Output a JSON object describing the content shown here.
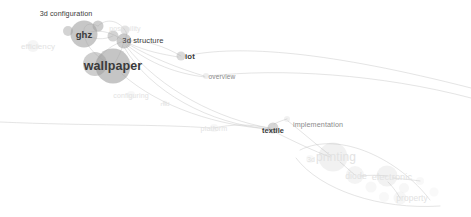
{
  "graph": {
    "title": "",
    "background_color": "#ffffff",
    "node_color": "#9e9e9e",
    "edge_color": "#c9c9c9",
    "label_color_strong": "#3a3a3a",
    "label_color_mid": "#8a8a8a",
    "label_color_faint": "#e2e2e2",
    "nodes": [
      {
        "id": "3d-configuration",
        "label": "3d configuration",
        "x": 98,
        "y": 26,
        "r": 5.5,
        "opacity": 0.5,
        "label_x": 66,
        "label_y": 13,
        "font_size": 7.2,
        "weight": "normal",
        "tone": "strong"
      },
      {
        "id": "ghz",
        "label": "ghz",
        "x": 84,
        "y": 34,
        "r": 13.5,
        "opacity": 0.58,
        "label_x": 84,
        "label_y": 34,
        "font_size": 9.5,
        "weight": "bold",
        "tone": "strong"
      },
      {
        "id": "ghz-sat-a",
        "label": "",
        "x": 68,
        "y": 31,
        "r": 5.0,
        "opacity": 0.45,
        "label_x": 0,
        "label_y": 0,
        "font_size": 0,
        "weight": "normal",
        "tone": "none"
      },
      {
        "id": "possibility",
        "label": "possibility",
        "x": 125,
        "y": 30,
        "r": 4.5,
        "opacity": 0.28,
        "label_x": 125,
        "label_y": 28,
        "font_size": 7.0,
        "weight": "normal",
        "tone": "faint"
      },
      {
        "id": "poss-sat",
        "label": "",
        "x": 113,
        "y": 36,
        "r": 5.5,
        "opacity": 0.45,
        "label_x": 0,
        "label_y": 0,
        "font_size": 0,
        "weight": "normal",
        "tone": "none"
      },
      {
        "id": "3d-structure",
        "label": "3d structure",
        "x": 124,
        "y": 41,
        "r": 7.5,
        "opacity": 0.55,
        "label_x": 143,
        "label_y": 40,
        "font_size": 7.6,
        "weight": "normal",
        "tone": "strong"
      },
      {
        "id": "wallpaper",
        "label": "wallpaper",
        "x": 113,
        "y": 66,
        "r": 17.5,
        "opacity": 0.6,
        "label_x": 113,
        "label_y": 66,
        "font_size": 12.5,
        "weight": "bold",
        "tone": "strong"
      },
      {
        "id": "wall-sat",
        "label": "",
        "x": 95,
        "y": 64,
        "r": 12.0,
        "opacity": 0.5,
        "label_x": 0,
        "label_y": 0,
        "font_size": 0,
        "weight": "normal",
        "tone": "none"
      },
      {
        "id": "efficiency",
        "label": "efficiency",
        "x": 33,
        "y": 46,
        "r": 6.0,
        "opacity": 0.1,
        "label_x": 38,
        "label_y": 46,
        "font_size": 8.0,
        "weight": "normal",
        "tone": "faint"
      },
      {
        "id": "iot",
        "label": "iot",
        "x": 181,
        "y": 56,
        "r": 4.5,
        "opacity": 0.38,
        "label_x": 190,
        "label_y": 56,
        "font_size": 7.8,
        "weight": "bold",
        "tone": "strong"
      },
      {
        "id": "overview",
        "label": "overview",
        "x": 206,
        "y": 76,
        "r": 3.0,
        "opacity": 0.18,
        "label_x": 222,
        "label_y": 76,
        "font_size": 6.6,
        "weight": "normal",
        "tone": "mid"
      },
      {
        "id": "configuring",
        "label": "configuring",
        "x": 131,
        "y": 95,
        "r": 4.0,
        "opacity": 0.08,
        "label_x": 131,
        "label_y": 95,
        "font_size": 7.0,
        "weight": "normal",
        "tone": "faint"
      },
      {
        "id": "rhi",
        "label": "rfid",
        "x": 165,
        "y": 103,
        "r": 2.5,
        "opacity": 0.08,
        "label_x": 165,
        "label_y": 103,
        "font_size": 6.2,
        "weight": "normal",
        "tone": "faint"
      },
      {
        "id": "platform",
        "label": "platform",
        "x": 214,
        "y": 128,
        "r": 4.0,
        "opacity": 0.08,
        "label_x": 214,
        "label_y": 128,
        "font_size": 7.2,
        "weight": "normal",
        "tone": "faint"
      },
      {
        "id": "textile",
        "label": "textile",
        "x": 273,
        "y": 128,
        "r": 5.5,
        "opacity": 0.42,
        "label_x": 273,
        "label_y": 130,
        "font_size": 7.4,
        "weight": "bold",
        "tone": "strong"
      },
      {
        "id": "implementation",
        "label": "implementation",
        "x": 287,
        "y": 119,
        "r": 3.0,
        "opacity": 0.14,
        "label_x": 318,
        "label_y": 124,
        "font_size": 7.2,
        "weight": "normal",
        "tone": "mid"
      },
      {
        "id": "printing",
        "label": "printing",
        "x": 333,
        "y": 157,
        "r": 14.5,
        "opacity": 0.14,
        "label_x": 336,
        "label_y": 157,
        "font_size": 12.0,
        "weight": "normal",
        "tone": "faint"
      },
      {
        "id": "3d-pre",
        "label": "3d",
        "x": 310,
        "y": 159,
        "r": 4.0,
        "opacity": 0.07,
        "label_x": 311,
        "label_y": 159,
        "font_size": 7.0,
        "weight": "normal",
        "tone": "faint"
      },
      {
        "id": "diode",
        "label": "diode",
        "x": 355,
        "y": 175,
        "r": 9.0,
        "opacity": 0.11,
        "label_x": 356,
        "label_y": 176,
        "font_size": 8.6,
        "weight": "normal",
        "tone": "faint"
      },
      {
        "id": "electronic",
        "label": "electronic",
        "x": 387,
        "y": 176,
        "r": 10.5,
        "opacity": 0.13,
        "label_x": 392,
        "label_y": 177,
        "font_size": 9.2,
        "weight": "normal",
        "tone": "faint"
      },
      {
        "id": "e-sat-1",
        "label": "",
        "x": 371,
        "y": 187,
        "r": 5.5,
        "opacity": 0.08,
        "label_x": 0,
        "label_y": 0,
        "font_size": 0,
        "weight": "normal",
        "tone": "none"
      },
      {
        "id": "e-sat-2",
        "label": "",
        "x": 404,
        "y": 188,
        "r": 5.0,
        "opacity": 0.08,
        "label_x": 0,
        "label_y": 0,
        "font_size": 0,
        "weight": "normal",
        "tone": "none"
      },
      {
        "id": "e-sat-3",
        "label": "",
        "x": 420,
        "y": 181,
        "r": 4.0,
        "opacity": 0.07,
        "label_x": 0,
        "label_y": 0,
        "font_size": 0,
        "weight": "normal",
        "tone": "none"
      },
      {
        "id": "e-sat-4",
        "label": "",
        "x": 434,
        "y": 192,
        "r": 4.5,
        "opacity": 0.06,
        "label_x": 0,
        "label_y": 0,
        "font_size": 0,
        "weight": "normal",
        "tone": "none"
      },
      {
        "id": "property",
        "label": "property",
        "x": 400,
        "y": 198,
        "r": 6.5,
        "opacity": 0.09,
        "label_x": 412,
        "label_y": 198,
        "font_size": 8.4,
        "weight": "normal",
        "tone": "faint"
      },
      {
        "id": "p-sat",
        "label": "",
        "x": 384,
        "y": 197,
        "r": 5.0,
        "opacity": 0.07,
        "label_x": 0,
        "label_y": 0,
        "font_size": 0,
        "weight": "normal",
        "tone": "none"
      }
    ],
    "edges": [
      {
        "from": "3d-configuration",
        "to": "ghz",
        "d": "M98,26 C90,22 82,24 84,34"
      },
      {
        "from": "3d-configuration",
        "to": "possibility",
        "d": "M98,26 C106,18 118,20 125,30"
      },
      {
        "from": "ghz",
        "to": "3d-structure",
        "d": "M84,34 C98,28 112,32 124,41"
      },
      {
        "from": "ghz",
        "to": "poss-sat",
        "d": "M84,34 C94,40 104,40 113,36"
      },
      {
        "from": "possibility",
        "to": "3d-structure",
        "d": "M125,30 C128,34 126,38 124,41"
      },
      {
        "from": "3d-structure",
        "to": "wallpaper",
        "d": "M124,41 C122,50 118,58 113,66"
      },
      {
        "from": "wallpaper",
        "to": "ghz",
        "d": "M113,66 C98,58 86,48 84,34"
      },
      {
        "from": "wallpaper",
        "to": "3d-structure-b",
        "d": "M96,62 C104,50 114,44 124,41"
      },
      {
        "from": "3d-structure",
        "to": "iot",
        "d": "M128,41 C146,40 164,46 181,56"
      },
      {
        "from": "3d-structure",
        "to": "iot-b",
        "d": "M128,43 C148,52 162,54 178,57"
      },
      {
        "from": "3d-structure",
        "to": "overview",
        "d": "M128,44 C152,58 178,68 204,76"
      },
      {
        "from": "3d-structure",
        "to": "overview-b",
        "d": "M127,45 C150,64 178,74 205,77"
      },
      {
        "from": "iot",
        "to": "right-out",
        "d": "M185,56 C240,44 330,52 471,88"
      },
      {
        "from": "overview",
        "to": "right-out",
        "d": "M209,76 C280,68 380,74 471,98"
      },
      {
        "from": "3d-structure",
        "to": "textile",
        "d": "M126,46 C160,90 220,120 270,128"
      },
      {
        "from": "3d-structure",
        "to": "textile-b",
        "d": "M124,47 C150,92 210,124 269,129"
      },
      {
        "from": "wallpaper",
        "to": "textile",
        "d": "M122,74 C160,108 220,126 270,129"
      },
      {
        "from": "textile",
        "to": "platform",
        "d": "M268,128 C250,124 232,124 214,128"
      },
      {
        "from": "platform",
        "to": "left-out",
        "d": "M210,128 C160,124 90,126 0,122"
      },
      {
        "from": "textile",
        "to": "implementation",
        "d": "M274,124 C280,121 284,120 287,119"
      },
      {
        "from": "textile",
        "to": "printing",
        "d": "M275,132 C295,142 314,151 330,157"
      },
      {
        "from": "implementation",
        "to": "printing",
        "d": "M288,121 C302,132 318,146 331,156"
      },
      {
        "from": "printing",
        "to": "diode",
        "d": "M340,162 C346,167 350,171 355,175"
      },
      {
        "from": "diode",
        "to": "electronic",
        "d": "M360,176 C370,175 379,175 387,176"
      },
      {
        "from": "electronic",
        "to": "property",
        "d": "M388,182 C394,188 397,193 400,198"
      },
      {
        "from": "electronic",
        "to": "e-sat-3",
        "d": "M393,178 C404,179 413,180 420,181"
      },
      {
        "from": "printing-halo",
        "to": "cluster-arc",
        "d": "M300,150 C340,130 400,160 430,200"
      },
      {
        "from": "printing-halo2",
        "to": "cluster-arc2",
        "d": "M296,158 C320,190 380,210 440,206"
      }
    ]
  }
}
